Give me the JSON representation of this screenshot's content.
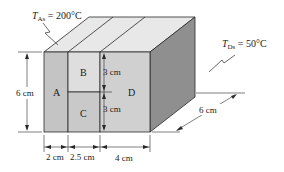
{
  "diagram": {
    "temperatures": {
      "left": {
        "symbol": "T",
        "subscript": "As",
        "value": " = 200°C"
      },
      "right": {
        "symbol": "T",
        "subscript": "Ds",
        "value": " = 50°C"
      }
    },
    "layers": [
      {
        "id": "A",
        "label": "A"
      },
      {
        "id": "B",
        "label": "B"
      },
      {
        "id": "C",
        "label": "C"
      },
      {
        "id": "D",
        "label": "D"
      }
    ],
    "dimensions": {
      "height": "6 cm",
      "b_height": "3 cm",
      "c_height": "3 cm",
      "a_width": "2 cm",
      "bc_width": "2.5 cm",
      "d_width": "4 cm",
      "depth": "6 cm"
    },
    "colors": {
      "front_a": "#c4c4c4",
      "front_b": "#dedede",
      "front_c": "#c9c9c9",
      "front_d": "#d0d0d0",
      "top": "#e8e8e8",
      "side": "#8f8f8f",
      "stroke": "#2a2a2a"
    }
  }
}
